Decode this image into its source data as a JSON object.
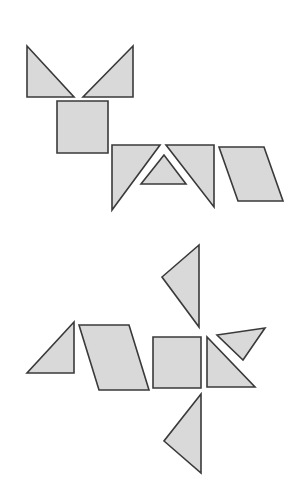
{
  "style": {
    "background": "#ffffff",
    "fill": "#d9d9d9",
    "stroke": "#3a3a3a"
  },
  "figures": [
    {
      "name": "tangram-figure-cat",
      "pieces": [
        {
          "name": "ear-left-triangle",
          "shape": "triangle",
          "points": "27,46 27,97 74,97"
        },
        {
          "name": "ear-right-triangle",
          "shape": "triangle",
          "points": "133,46 83,97 133,97"
        },
        {
          "name": "head-square",
          "shape": "square",
          "points": "57,101 108,101 108,153 57,153"
        },
        {
          "name": "body-left-large-triangle",
          "shape": "triangle",
          "points": "112,145 160,145 112,210"
        },
        {
          "name": "body-middle-small-triangle",
          "shape": "triangle",
          "points": "164,155 141,184 186,184"
        },
        {
          "name": "body-right-large-triangle",
          "shape": "triangle",
          "points": "166,145 214,145 214,207"
        },
        {
          "name": "tail-parallelogram",
          "shape": "parallelogram",
          "points": "219,147 264,147 283,201 238,201"
        }
      ]
    },
    {
      "name": "tangram-figure-bird",
      "pieces": [
        {
          "name": "upper-wing-triangle",
          "shape": "triangle",
          "points": "199,245 162,277 199,327"
        },
        {
          "name": "tail-triangle",
          "shape": "triangle",
          "points": "74,322 27,373 74,373"
        },
        {
          "name": "body-parallelogram",
          "shape": "parallelogram",
          "points": "79,325 129,325 149,390 99,390"
        },
        {
          "name": "body-square",
          "shape": "square",
          "points": "153,337 201,337 201,388 153,388"
        },
        {
          "name": "head-triangle",
          "shape": "triangle",
          "points": "207,337 207,387 255,387"
        },
        {
          "name": "beak-small-triangle",
          "shape": "triangle",
          "points": "217,335 265,328 243,360"
        },
        {
          "name": "lower-wing-triangle",
          "shape": "triangle",
          "points": "201,394 164,441 201,473"
        }
      ]
    }
  ]
}
